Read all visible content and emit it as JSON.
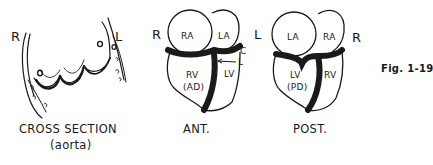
{
  "figure": {
    "label": "Fig. 1-19"
  },
  "panels": [
    {
      "id": "cross-section",
      "side_left": "R",
      "side_right": "L",
      "caption": "CROSS SECTION",
      "subcaption": "(aorta)"
    },
    {
      "id": "anterior",
      "side_left": "R",
      "side_right": "L",
      "caption": "ANT.",
      "chambers": {
        "ra": "RA",
        "la": "LA",
        "rv": "RV",
        "rv_sub": "(AD)",
        "lv": "LV"
      },
      "arrows": {
        "c": "C",
        "l": "L"
      }
    },
    {
      "id": "posterior",
      "side_right": "R",
      "caption": "POST.",
      "chambers": {
        "la": "LA",
        "ra": "RA",
        "lv": "LV",
        "lv_sub": "(PD)",
        "rv": "RV"
      }
    }
  ]
}
